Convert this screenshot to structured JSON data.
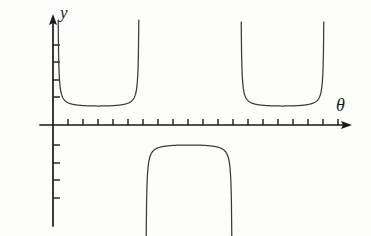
{
  "figure": {
    "background_color": "#fdfdfb",
    "ink_color": "#3a3a3a",
    "axis_color": "#1a1a1a"
  },
  "axes": {
    "y_label": "y",
    "x_label": "θ",
    "origin": {
      "x": 53,
      "y": 125
    },
    "x_axis": {
      "start_x": 40,
      "end_x": 352,
      "y": 125,
      "arrow": "right"
    },
    "y_axis": {
      "x": 53,
      "start_y": 226,
      "end_y": 14,
      "arrow": "up"
    },
    "x_ticks": [
      68,
      83,
      98,
      113,
      128,
      143,
      158,
      173,
      188,
      203,
      218,
      233,
      248,
      263,
      278,
      293,
      308,
      323,
      338
    ],
    "y_ticks_above": [
      45,
      62,
      80,
      97
    ],
    "y_ticks_below": [
      145,
      163,
      180,
      198
    ],
    "tick_length_x": 6,
    "tick_length_y": 7
  },
  "chart_data": {
    "type": "line",
    "title": "",
    "xlabel": "θ",
    "ylabel": "y",
    "grid": false,
    "legend": null,
    "xlim": [
      -1,
      20
    ],
    "ylim": [
      -7,
      8
    ],
    "branches": [
      {
        "name": "left-upward-branch",
        "orientation": "up",
        "vertex_px": {
          "x": 98,
          "y": 106
        },
        "left_asymptote_px": 58,
        "right_asymptote_px": 139,
        "top_px": 20
      },
      {
        "name": "middle-downward-branch",
        "orientation": "down",
        "vertex_px": {
          "x": 189,
          "y": 145
        },
        "left_asymptote_px": 146,
        "right_asymptote_px": 232,
        "bottom_px": 236
      },
      {
        "name": "right-upward-branch",
        "orientation": "up",
        "vertex_px": {
          "x": 282,
          "y": 106
        },
        "left_asymptote_px": 241,
        "right_asymptote_px": 324,
        "top_px": 22
      }
    ]
  }
}
